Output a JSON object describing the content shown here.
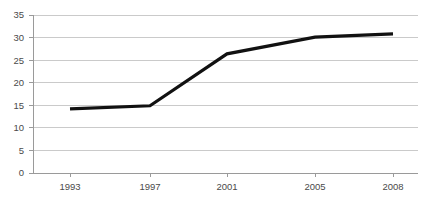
{
  "chart_data": {
    "type": "line",
    "title": "",
    "subtitle": "",
    "xlabel": "",
    "ylabel": "",
    "categories": [
      "1993",
      "1997",
      "2001",
      "2005",
      "2008"
    ],
    "values": [
      14.2,
      14.9,
      26.4,
      30.1,
      30.8
    ],
    "series": [
      {
        "name": "",
        "values": [
          14.2,
          14.9,
          26.4,
          30.1,
          30.8
        ]
      }
    ],
    "ylim": [
      0,
      35
    ],
    "y_ticks": [
      "0",
      "5",
      "10",
      "15",
      "20",
      "25",
      "30",
      "35"
    ],
    "y_tick_values": [
      0,
      5,
      10,
      15,
      20,
      25,
      30,
      35
    ],
    "x_ticks": [
      "1993",
      "1997",
      "2001",
      "2005",
      "2008"
    ],
    "x_positions": [
      70,
      150,
      227,
      315,
      393
    ],
    "grid": "horizontal",
    "legend": "none",
    "colors": {
      "line": "#111111",
      "gridline": "#bdbdbd",
      "axis": "#9a9a9a",
      "text": "#4a4a4a",
      "background": "#ffffff"
    },
    "plot_area": {
      "left": 33,
      "right": 418,
      "top": 15,
      "bottom": 173
    }
  }
}
